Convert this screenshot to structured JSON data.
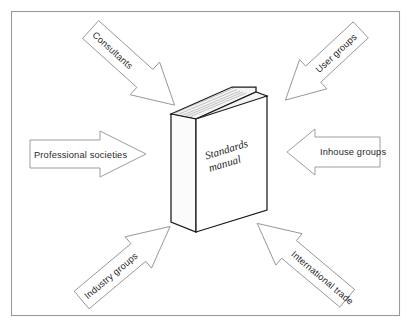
{
  "figure": {
    "kind": "influences-diagram",
    "frame": {
      "border_color": "#9a9a9a",
      "background_color": "#ffffff"
    },
    "center": {
      "name": "standards-manual-book",
      "title_line_1": "Standards",
      "title_line_2": "manual",
      "outline_color": "#1b1b1b",
      "cover_color": "#ffffff",
      "pages_color": "#f4f4f4"
    },
    "arrows": [
      {
        "id": "consultants",
        "label": "Consultants",
        "direction": "down-right",
        "position": "top-left",
        "points_to": "standards-manual-book"
      },
      {
        "id": "user-groups",
        "label": "User groups",
        "direction": "down-left",
        "position": "top-right",
        "points_to": "standards-manual-book"
      },
      {
        "id": "professional-societies",
        "label": "Professional societies",
        "direction": "right",
        "position": "left",
        "points_to": "standards-manual-book"
      },
      {
        "id": "inhouse-groups",
        "label": "Inhouse groups",
        "direction": "left",
        "position": "right",
        "points_to": "standards-manual-book"
      },
      {
        "id": "industry-groups",
        "label": "Industry groups",
        "direction": "up-right",
        "position": "bottom-left",
        "points_to": "standards-manual-book"
      },
      {
        "id": "international-trade",
        "label": "International trade",
        "direction": "up-left",
        "position": "bottom-right",
        "points_to": "standards-manual-book"
      }
    ]
  }
}
